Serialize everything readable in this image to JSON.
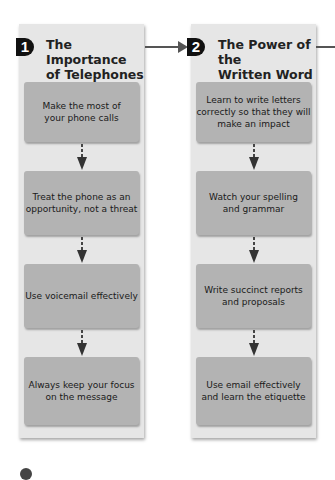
{
  "columns": [
    {
      "number": "1",
      "title": "The Importance\nof Telephones",
      "steps": [
        "Make the most of\nyour phone calls",
        "Treat the phone as an\nopportunity, not a threat",
        "Use voicemail effectively",
        "Always keep your focus\non the message"
      ]
    },
    {
      "number": "2",
      "title": "The Power of the\nWritten Word",
      "steps": [
        "Learn to write letters\ncorrectly so that they will\nmake an impact",
        "Watch your spelling\nand grammar",
        "Write succinct reports\nand proposals",
        "Use email effectively\nand learn the etiquette"
      ]
    }
  ],
  "colors": {
    "panel": "#e6e6e6",
    "box": "#b3b3b3",
    "badge": "#111111",
    "arrow": "#555555"
  }
}
